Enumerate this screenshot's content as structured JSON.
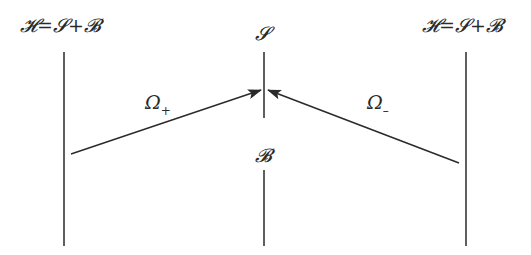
{
  "diagram": {
    "labels": {
      "left_space": "𝓗=𝓢+𝓑",
      "right_space": "𝓗=𝓢+𝓑",
      "center_top": "𝓢",
      "center_bottom": "𝓑",
      "omega_plus": "Ω",
      "omega_plus_sub": "+",
      "omega_minus": "Ω",
      "omega_minus_sub": "–"
    },
    "lines": [
      {
        "id": "left-axis",
        "x1": 64,
        "y1": 52,
        "x2": 64,
        "y2": 246
      },
      {
        "id": "right-axis",
        "x1": 466,
        "y1": 52,
        "x2": 466,
        "y2": 246
      },
      {
        "id": "center-top-axis",
        "x1": 264,
        "y1": 52,
        "x2": 264,
        "y2": 118
      },
      {
        "id": "center-bottom-axis",
        "x1": 264,
        "y1": 170,
        "x2": 264,
        "y2": 246
      }
    ],
    "arrows": [
      {
        "id": "omega-plus-arrow",
        "from": [
          71,
          154
        ],
        "to": [
          261,
          90
        ]
      },
      {
        "id": "omega-minus-arrow",
        "from": [
          459,
          163
        ],
        "to": [
          268,
          90
        ]
      }
    ],
    "colors": {
      "stroke": "#2a2a2a",
      "background": "#ffffff"
    }
  }
}
